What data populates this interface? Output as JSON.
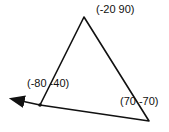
{
  "diagram": {
    "type": "triangle-with-direction-arrow",
    "vertices": [
      {
        "id": "top",
        "label": "(-20 90)"
      },
      {
        "id": "left",
        "label": "(-80 -40)"
      },
      {
        "id": "right",
        "label": "(70 -70)"
      }
    ],
    "stroke_color": "#111111",
    "background_color": "#ffffff"
  }
}
